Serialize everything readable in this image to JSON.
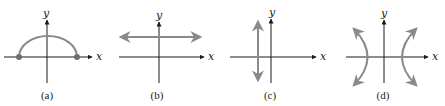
{
  "colors": {
    "axis": "#1a1a1a",
    "curve": "#8a8a8a",
    "point": "#6e6e6e",
    "text": "#222222"
  },
  "panels": [
    {
      "id": "a",
      "caption": "(a)",
      "x_label": "x",
      "y_label": "y",
      "graph": "upper semicircle with endpoints on x-axis (closed dots)"
    },
    {
      "id": "b",
      "caption": "(b)",
      "x_label": "x",
      "y_label": "y",
      "graph": "horizontal line above x-axis with arrows at both ends"
    },
    {
      "id": "c",
      "caption": "(c)",
      "x_label": "x",
      "y_label": "y",
      "graph": "vertical line left of y-axis with arrows at both ends"
    },
    {
      "id": "d",
      "caption": "(d)",
      "x_label": "x",
      "y_label": "y",
      "graph": "hyperbola opening left and right with arrows on branches"
    }
  ]
}
